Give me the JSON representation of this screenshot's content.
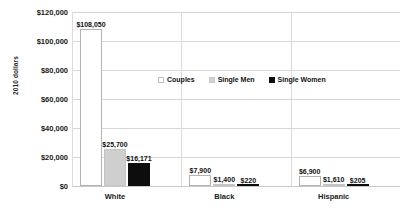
{
  "chart_data": {
    "type": "bar",
    "title": "",
    "xlabel": "",
    "ylabel": "2010 dollars",
    "categories": [
      "White",
      "Black",
      "Hispanic"
    ],
    "ylim": [
      0,
      120000
    ],
    "yticks": [
      0,
      20000,
      40000,
      60000,
      80000,
      100000,
      120000
    ],
    "ytick_labels": [
      "$0",
      "$20,000",
      "$40,000",
      "$60,000",
      "$80,000",
      "$100,000",
      "$120,000"
    ],
    "grid": true,
    "legend_position": "inside-upper-center",
    "series": [
      {
        "name": "Couples",
        "color": "#ffffff",
        "border": "#b4b4b4",
        "values": [
          108050,
          7900,
          6900
        ],
        "labels": [
          "$108,050",
          "$7,900",
          "$6,900"
        ]
      },
      {
        "name": "Single Men",
        "color": "#cfcfcf",
        "border": "#c4c4c4",
        "values": [
          25700,
          1400,
          1610
        ],
        "labels": [
          "$25,700",
          "$1,400",
          "$1,610"
        ]
      },
      {
        "name": "Single Women",
        "color": "#0d0d0d",
        "border": "#0d0d0d",
        "values": [
          16171,
          220,
          205
        ],
        "labels": [
          "$16,171",
          "$220",
          "$205"
        ]
      }
    ]
  },
  "axis": {
    "y_title": "2010 dollars",
    "ticks": [
      {
        "label": "$120,000",
        "value": 120000
      },
      {
        "label": "$100,000",
        "value": 100000
      },
      {
        "label": "$80,000",
        "value": 80000
      },
      {
        "label": "$60,000",
        "value": 60000
      },
      {
        "label": "$40,000",
        "value": 40000
      },
      {
        "label": "$20,000",
        "value": 20000
      },
      {
        "label": "$0",
        "value": 0
      }
    ]
  },
  "legend": {
    "items": [
      {
        "label": "Couples",
        "key": "couples"
      },
      {
        "label": "Single Men",
        "key": "single-men"
      },
      {
        "label": "Single Women",
        "key": "single-women"
      }
    ]
  },
  "categories": [
    {
      "label": "White"
    },
    {
      "label": "Black"
    },
    {
      "label": "Hispanic"
    }
  ]
}
